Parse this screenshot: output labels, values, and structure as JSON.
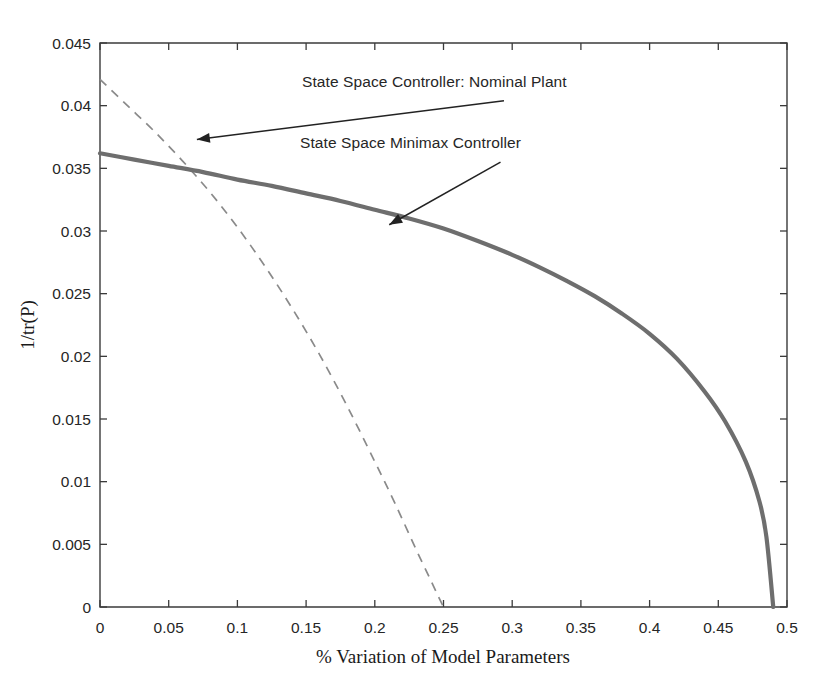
{
  "chart_data": {
    "type": "line",
    "title": "",
    "xlabel": "% Variation of Model Parameters",
    "ylabel": "1/tr(P)",
    "xlim": [
      0,
      0.5
    ],
    "ylim": [
      0,
      0.045
    ],
    "grid": false,
    "legend_position": "none",
    "xticks": [
      0,
      0.05,
      0.1,
      0.15,
      0.2,
      0.25,
      0.3,
      0.35,
      0.4,
      0.45,
      0.5
    ],
    "xtick_labels": [
      "0",
      "0.05",
      "0.1",
      "0.15",
      "0.2",
      "0.25",
      "0.3",
      "0.35",
      "0.4",
      "0.45",
      "0.5"
    ],
    "yticks": [
      0,
      0.005,
      0.01,
      0.015,
      0.02,
      0.025,
      0.03,
      0.035,
      0.04,
      0.045
    ],
    "ytick_labels": [
      "0",
      "0.005",
      "0.01",
      "0.015",
      "0.02",
      "0.025",
      "0.03",
      "0.035",
      "0.04",
      "0.045"
    ],
    "series": [
      {
        "name": "State Space Minimax Controller",
        "style": "solid",
        "color": "#6e6e6e",
        "linewidth": 4.2,
        "x": [
          0,
          0.025,
          0.05,
          0.075,
          0.1,
          0.125,
          0.15,
          0.175,
          0.2,
          0.225,
          0.25,
          0.275,
          0.3,
          0.32,
          0.34,
          0.36,
          0.38,
          0.4,
          0.42,
          0.44,
          0.455,
          0.47,
          0.48,
          0.485,
          0.49
        ],
        "values": [
          0.0362,
          0.0357,
          0.0352,
          0.0347,
          0.0341,
          0.0336,
          0.033,
          0.0324,
          0.0317,
          0.031,
          0.0302,
          0.0292,
          0.0281,
          0.0271,
          0.026,
          0.0248,
          0.0234,
          0.0218,
          0.0198,
          0.0172,
          0.0148,
          0.0116,
          0.0084,
          0.0056,
          0.0
        ]
      },
      {
        "name": "State Space Controller: Nominal Plant",
        "style": "dashed",
        "color": "#8a8a8a",
        "linewidth": 1.7,
        "x": [
          0,
          0.02,
          0.04,
          0.06,
          0.08,
          0.1,
          0.12,
          0.14,
          0.16,
          0.18,
          0.2,
          0.215,
          0.23,
          0.24,
          0.246,
          0.25
        ],
        "values": [
          0.0421,
          0.04,
          0.0379,
          0.0356,
          0.0331,
          0.0303,
          0.0272,
          0.0238,
          0.0201,
          0.016,
          0.0116,
          0.0082,
          0.0046,
          0.0023,
          0.0009,
          0.0
        ]
      }
    ],
    "annotations": [
      {
        "id": "nominal",
        "text": "State Space Controller: Nominal Plant",
        "text_x": 0.294,
        "text_y": 0.0404,
        "point_x": 0.0705,
        "point_y": 0.0373
      },
      {
        "id": "minimax",
        "text": "State Space Minimax Controller",
        "text_x": 0.2915,
        "text_y": 0.0355,
        "point_x": 0.2105,
        "point_y": 0.0305
      }
    ]
  },
  "axis_titles": {
    "x": "% Variation of Model Parameters",
    "y": "1/tr(P)"
  }
}
